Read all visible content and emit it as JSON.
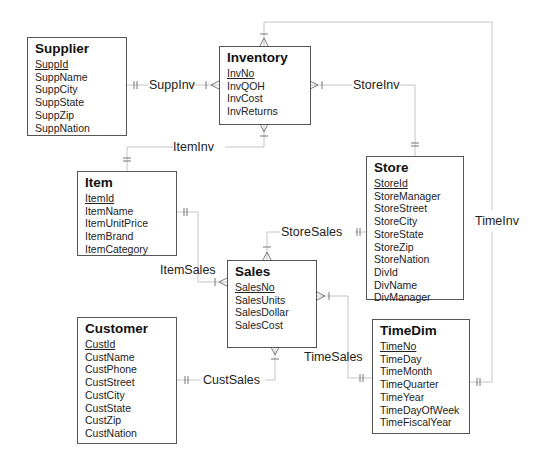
{
  "diagram": {
    "type": "entity-relationship (crow's foot)",
    "entities": {
      "supplier": {
        "name": "Supplier",
        "pk": "SuppId",
        "attributes": [
          "SuppName",
          "SuppCity",
          "SuppState",
          "SuppZip",
          "SuppNation"
        ]
      },
      "inventory": {
        "name": "Inventory",
        "pk": "InvNo",
        "attributes": [
          "InvQOH",
          "InvCost",
          "InvReturns"
        ]
      },
      "item": {
        "name": "Item",
        "pk": "ItemId",
        "attributes": [
          "ItemName",
          "ItemUnitPrice",
          "ItemBrand",
          "ItemCategory"
        ]
      },
      "store": {
        "name": "Store",
        "pk": "StoreId",
        "attributes": [
          "StoreManager",
          "StoreStreet",
          "StoreCity",
          "StoreState",
          "StoreZip",
          "StoreNation",
          "DivId",
          "DivName",
          "DivManager"
        ]
      },
      "sales": {
        "name": "Sales",
        "pk": "SalesNo",
        "attributes": [
          "SalesUnits",
          "SalesDollar",
          "SalesCost"
        ]
      },
      "customer": {
        "name": "Customer",
        "pk": "CustId",
        "attributes": [
          "CustName",
          "CustPhone",
          "CustStreet",
          "CustCity",
          "CustState",
          "CustZip",
          "CustNation"
        ]
      },
      "timedim": {
        "name": "TimeDim",
        "pk": "TimeNo",
        "attributes": [
          "TimeDay",
          "TimeMonth",
          "TimeQuarter",
          "TimeYear",
          "TimeDayOfWeek",
          "TimeFiscalYear"
        ]
      }
    },
    "relationships": {
      "suppinv": {
        "label": "SuppInv",
        "one": "Supplier",
        "many": "Inventory"
      },
      "storeinv": {
        "label": "StoreInv",
        "one": "Store",
        "many": "Inventory"
      },
      "iteminv": {
        "label": "ItemInv",
        "one": "Item",
        "many": "Inventory"
      },
      "timeinv": {
        "label": "TimeInv",
        "one": "TimeDim",
        "many": "Inventory"
      },
      "storesales": {
        "label": "StoreSales",
        "one": "Store",
        "many": "Sales"
      },
      "itemsales": {
        "label": "ItemSales",
        "one": "Item",
        "many": "Sales"
      },
      "custsales": {
        "label": "CustSales",
        "one": "Customer",
        "many": "Sales"
      },
      "timesales": {
        "label": "TimeSales",
        "one": "TimeDim",
        "many": "Sales"
      }
    },
    "colors": {
      "line": "#bbbbbb",
      "box_border": "#555555",
      "text": "#222222"
    }
  }
}
